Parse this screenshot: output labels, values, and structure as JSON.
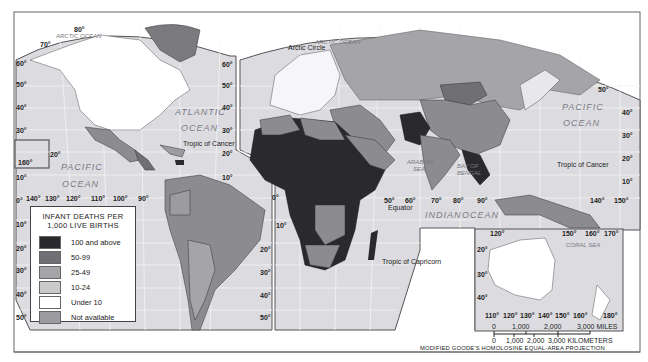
{
  "title": "INFANT DEATHS PER 1,000 LIVE BIRTHS",
  "legend": {
    "title_line1": "INFANT DEATHS PER",
    "title_line2": "1,000 LIVE BIRTHS",
    "items": [
      {
        "label": "100 and above",
        "color": "#2a2a2e"
      },
      {
        "label": "50-99",
        "color": "#6f6f74"
      },
      {
        "label": "25-49",
        "color": "#a5a5a9"
      },
      {
        "label": "10-24",
        "color": "#cacacd"
      },
      {
        "label": "Under 10",
        "color": "#ffffff"
      },
      {
        "label": "Not available",
        "color": "#9c9ca0"
      }
    ]
  },
  "oceans": {
    "arctic_left": "ARCTIC OCEAN",
    "arctic_right": "ARCTIC OCEAN",
    "atlantic1": "ATLANTIC",
    "atlantic2": "OCEAN",
    "pacific_left1": "PACIFIC",
    "pacific_left2": "OCEAN",
    "pacific_right1": "PACIFIC",
    "pacific_right2": "OCEAN",
    "indian1": "INDIAN",
    "indian2": "OCEAN",
    "arabian1": "ARABIAN",
    "arabian2": "SEA",
    "bengal1": "BAY OF",
    "bengal2": "BENGAL",
    "coral": "CORAL SEA"
  },
  "lines": {
    "arctic_circle": "Arctic Circle",
    "tropic_cancer_left": "Tropic of Cancer",
    "tropic_cancer_right": "Tropic of Cancer",
    "equator": "Equator",
    "tropic_capricorn": "Tropic of Capricorn"
  },
  "lat_labels": {
    "left_edge": [
      "80°",
      "70°",
      "60°",
      "50°",
      "40°",
      "30°",
      "20°",
      "10°",
      "0°",
      "10°",
      "20°",
      "30°",
      "40°",
      "50°"
    ],
    "mid": [
      "60°",
      "50°",
      "40°",
      "30°",
      "20°",
      "10°",
      "0°",
      "10°",
      "20°",
      "30°",
      "40°",
      "50°"
    ],
    "right": [
      "50°",
      "40°",
      "30°",
      "20°",
      "10°"
    ]
  },
  "lon_labels": {
    "pacific": [
      "140°",
      "130°",
      "120°",
      "110°",
      "100°",
      "90°"
    ],
    "inset_hawaii": "160°",
    "indian": [
      "50°",
      "60°",
      "70°",
      "80°",
      "90°"
    ],
    "east": [
      "140°",
      "150°"
    ],
    "australia_top": [
      "120°",
      "150°",
      "160°",
      "170°"
    ],
    "australia_bottom": [
      "110°",
      "120°",
      "130°",
      "140°",
      "150°",
      "160°",
      "180°"
    ],
    "australia_lat": [
      "20°",
      "30°",
      "40°"
    ]
  },
  "scale": {
    "miles": [
      "0",
      "1,000",
      "2,000",
      "3,000 MILES"
    ],
    "km": [
      "0",
      "1,000",
      "2,000",
      "3,000 KILOMETERS"
    ]
  },
  "projection": "MODIFIED GOODE'S HOMOLOSINE EQUAL-AREA PROJECTION"
}
